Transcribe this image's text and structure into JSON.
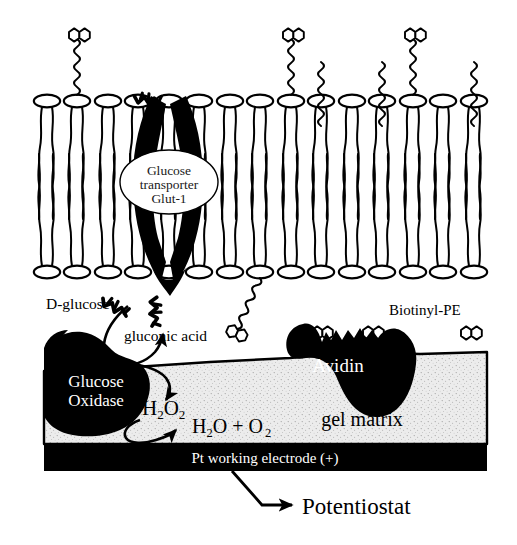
{
  "figure": {
    "background_color": "#ffffff",
    "ink_color": "#000000",
    "gel_color": "#ececec",
    "gel_speckle_color": "#9a9a9a"
  },
  "labels": {
    "glucose_transporter": "Glucose\ntransporter\nGlut-1",
    "glucose_transporter_lines": [
      "Glucose",
      "transporter",
      "Glut-1"
    ],
    "d_glucose": "D-glucose",
    "gluconic_acid": "gluconic acid",
    "biotinyl_pe": "Biotinyl-PE",
    "avidin": "Avidin",
    "glucose_oxidase_lines": [
      "Glucose",
      "Oxidase"
    ],
    "hydrogen_peroxide": "H2O2",
    "hydrogen_peroxide_parts": {
      "h": "H",
      "two_a": "2",
      "o": "O",
      "two_b": "2"
    },
    "products": "H2O + O2",
    "products_parts": {
      "h": "H",
      "sub2a": "2",
      "o": "O",
      "plus": " + ",
      "o2": "O",
      "sub2b": "2"
    },
    "gel_matrix": "gel matrix",
    "pt_electrode": "Pt working electrode (+)",
    "potentiostat": "Potentiostat"
  },
  "structures": {
    "bilayer": {
      "lipid_count": 15,
      "head_shape": "ellipse",
      "head_fill": "#ffffff",
      "head_stroke": "#000000",
      "tails_per_lipid": 2,
      "top_head_y": 101,
      "bottom_head_y": 272,
      "left_x": 47,
      "spacing": 30.5
    },
    "biotinyl_pe_top": {
      "count": 3,
      "lipid_indices": [
        1,
        8,
        12
      ],
      "description": "biotin head on coiled spacer extending above outer leaflet"
    },
    "biotinyl_pe_bottom": {
      "count": 4,
      "lipid_indices": [
        7,
        9,
        11,
        14
      ],
      "bound_to_avidin": [
        9,
        11
      ],
      "description": "biotin head on coiled spacer extending below inner leaflet"
    },
    "glut1": {
      "fill": "#000000",
      "shape": "hourglass channel spanning bilayer",
      "label_ellipse_fill": "#ffffff"
    },
    "avidin": {
      "fill": "#000000",
      "binding_pockets": 2,
      "label_color": "#ffffff"
    },
    "glucose_oxidase": {
      "fill": "#000000",
      "label_color": "#ffffff"
    },
    "gel_matrix": {
      "fill": "#ececec",
      "texture": "stipple",
      "x": 44,
      "y": 352,
      "width": 443,
      "height": 92
    },
    "electrode": {
      "fill": "#000000",
      "label_color": "#ffffff",
      "x": 44,
      "y": 444,
      "width": 443,
      "height": 26
    }
  },
  "arrows": [
    {
      "name": "d-glucose-into-oxidase",
      "from": "D-glucose",
      "to": "Glucose Oxidase"
    },
    {
      "name": "oxidase-to-gluconic-acid",
      "from": "Glucose Oxidase",
      "to": "gluconic acid"
    },
    {
      "name": "oxidase-to-peroxide",
      "from": "Glucose Oxidase",
      "to": "H2O2"
    },
    {
      "name": "peroxide-to-products",
      "from": "H2O2",
      "to": "H2O + O2"
    },
    {
      "name": "electrode-to-potentiostat",
      "from": "Pt working electrode (+)",
      "to": "Potentiostat"
    }
  ]
}
